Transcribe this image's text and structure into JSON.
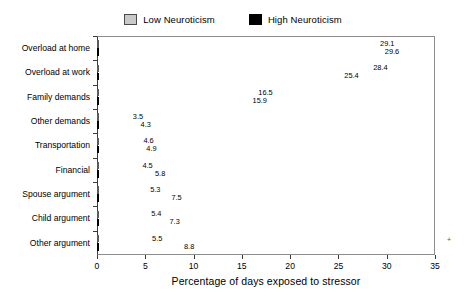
{
  "chart_data": {
    "type": "bar",
    "orientation": "horizontal",
    "title": "",
    "xlabel": "Percentage of days exposed to stressor",
    "ylabel": "",
    "xlim": [
      0,
      35
    ],
    "xticks": [
      0,
      5,
      10,
      15,
      20,
      25,
      30,
      35
    ],
    "xtick_labels": [
      "0",
      "5",
      "10",
      "15",
      "20",
      "25",
      "30",
      "35"
    ],
    "grid": false,
    "legend_position": "top-center",
    "categories": [
      "Overload at home",
      "Overload at work",
      "Family demands",
      "Other demands",
      "Transportation",
      "Financial",
      "Spouse argument",
      "Child argument",
      "Other argument"
    ],
    "series": [
      {
        "name": "Low Neuroticism",
        "color": "#c9c9c9",
        "values": [
          29.1,
          28.4,
          16.5,
          3.5,
          4.6,
          4.5,
          5.3,
          5.4,
          5.5
        ],
        "labels": [
          "29.1",
          "28.4",
          "16.5",
          "3.5",
          "4.6",
          "4.5",
          "5.3",
          "5.4",
          "5.5"
        ]
      },
      {
        "name": "High Neuroticism",
        "color": "#000000",
        "values": [
          29.6,
          25.4,
          15.9,
          4.3,
          4.9,
          5.8,
          7.5,
          7.3,
          8.8
        ],
        "labels": [
          "29.6",
          "25.4",
          "15.9",
          "4.3",
          "4.9",
          "5.8",
          "7.5",
          "7.3",
          "8.8"
        ]
      }
    ]
  },
  "legend": {
    "entries": [
      {
        "label": "Low Neuroticism",
        "swatch": "low-neuroticism-swatch"
      },
      {
        "label": "High Neuroticism",
        "swatch": "high-neuroticism-swatch"
      }
    ]
  },
  "axis": {
    "x_title": "Percentage of days exposed to stressor"
  },
  "artifacts": {
    "stray_mark": "+"
  }
}
